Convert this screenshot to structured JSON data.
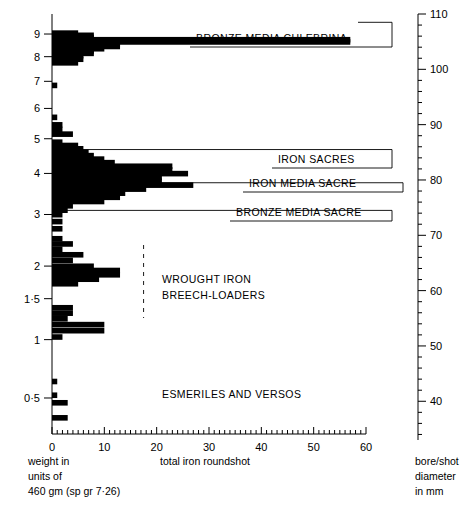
{
  "chart_data": {
    "type": "bar",
    "orientation": "horizontal",
    "title": "",
    "xlabel": "total iron roundshot",
    "ylabel": "weight in units of 460 gm (sp gr 7·26)",
    "ylabel_lines": [
      "weight in",
      "units of",
      "460 gm (sp gr 7·26)"
    ],
    "xlim": [
      0,
      60
    ],
    "xticks": [
      0,
      10,
      20,
      30,
      40,
      50,
      60
    ],
    "xtick_labels": [
      "0",
      "10",
      "20",
      "30",
      "40",
      "50",
      "60"
    ],
    "x_minor_step": 1,
    "grid": false,
    "legend": "none",
    "yticks": [
      0.5,
      1,
      1.5,
      2,
      3,
      4,
      5,
      6,
      7,
      8,
      9
    ],
    "ytick_labels": [
      "0·5",
      "1",
      "1·5",
      "2",
      "3",
      "4",
      "5",
      "6",
      "7",
      "8",
      "9"
    ],
    "secondary_axis": {
      "label_lines": [
        "bore/shot",
        "diameter",
        "in mm"
      ],
      "ticks": [
        40,
        50,
        60,
        70,
        80,
        90,
        100,
        110
      ],
      "tick_labels": [
        "40",
        "50",
        "60",
        "70",
        "80",
        "90",
        "100",
        "110"
      ],
      "minor_step": 2,
      "range_mm": [
        33,
        110
      ]
    },
    "bars": [
      {
        "y": 9.05,
        "value": 5
      },
      {
        "y": 8.95,
        "value": 8
      },
      {
        "y": 8.85,
        "value": 8
      },
      {
        "y": 8.75,
        "value": 57
      },
      {
        "y": 8.65,
        "value": 57
      },
      {
        "y": 8.55,
        "value": 13
      },
      {
        "y": 8.45,
        "value": 13
      },
      {
        "y": 8.35,
        "value": 10
      },
      {
        "y": 8.25,
        "value": 8
      },
      {
        "y": 8.15,
        "value": 8
      },
      {
        "y": 8.05,
        "value": 6
      },
      {
        "y": 7.9,
        "value": 6
      },
      {
        "y": 7.75,
        "value": 5
      },
      {
        "y": 6.85,
        "value": 1
      },
      {
        "y": 5.7,
        "value": 1
      },
      {
        "y": 5.45,
        "value": 2
      },
      {
        "y": 5.3,
        "value": 2
      },
      {
        "y": 5.15,
        "value": 4
      },
      {
        "y": 4.9,
        "value": 2
      },
      {
        "y": 4.8,
        "value": 5
      },
      {
        "y": 4.7,
        "value": 6
      },
      {
        "y": 4.6,
        "value": 7
      },
      {
        "y": 4.5,
        "value": 8
      },
      {
        "y": 4.4,
        "value": 10
      },
      {
        "y": 4.3,
        "value": 12
      },
      {
        "y": 4.2,
        "value": 23
      },
      {
        "y": 4.1,
        "value": 23
      },
      {
        "y": 4.0,
        "value": 26
      },
      {
        "y": 3.9,
        "value": 21
      },
      {
        "y": 3.8,
        "value": 21
      },
      {
        "y": 3.7,
        "value": 27
      },
      {
        "y": 3.6,
        "value": 18
      },
      {
        "y": 3.5,
        "value": 14
      },
      {
        "y": 3.4,
        "value": 13
      },
      {
        "y": 3.3,
        "value": 10
      },
      {
        "y": 3.2,
        "value": 4
      },
      {
        "y": 3.1,
        "value": 3
      },
      {
        "y": 3.0,
        "value": 2
      },
      {
        "y": 2.85,
        "value": 2
      },
      {
        "y": 2.7,
        "value": 2
      },
      {
        "y": 2.5,
        "value": 2
      },
      {
        "y": 2.4,
        "value": 4
      },
      {
        "y": 2.3,
        "value": 2
      },
      {
        "y": 2.2,
        "value": 6
      },
      {
        "y": 2.1,
        "value": 4
      },
      {
        "y": 2.0,
        "value": 8
      },
      {
        "y": 1.93,
        "value": 13
      },
      {
        "y": 1.86,
        "value": 13
      },
      {
        "y": 1.79,
        "value": 9
      },
      {
        "y": 1.72,
        "value": 5
      },
      {
        "y": 1.38,
        "value": 4
      },
      {
        "y": 1.31,
        "value": 4
      },
      {
        "y": 1.24,
        "value": 3
      },
      {
        "y": 1.17,
        "value": 10
      },
      {
        "y": 1.1,
        "value": 10
      },
      {
        "y": 1.03,
        "value": 2
      },
      {
        "y": 0.62,
        "value": 1
      },
      {
        "y": 0.52,
        "value": 1
      },
      {
        "y": 0.47,
        "value": 3
      },
      {
        "y": 0.38,
        "value": 3
      }
    ],
    "annotations": [
      {
        "name": "bronze-media-culebrina",
        "text": "BRONZE MEDIA CULEBRINA",
        "mm": 108.5,
        "text_x": 196,
        "text_y": 42,
        "elbow_x": 392,
        "stub_x": 358
      },
      {
        "name": "iron-sacres",
        "text": "IRON SACRES",
        "mm": 85.5,
        "text_x": 278,
        "text_y": 163,
        "elbow_x": 392,
        "stub_x": 64
      },
      {
        "name": "iron-media-sacre",
        "text": "IRON MEDIA SACRE",
        "mm": 79.5,
        "text_x": 249,
        "text_y": 187,
        "elbow_x": 403,
        "stub_x": 56
      },
      {
        "name": "bronze-media-sacre",
        "text": "BRONZE MEDIA SACRE",
        "mm": 74.5,
        "text_x": 236,
        "text_y": 216,
        "elbow_x": 392,
        "stub_x": 60
      }
    ],
    "group_labels": [
      {
        "name": "wrought-iron-breech-loaders",
        "lines": [
          "WROUGHT IRON",
          "BREECH-LOADERS"
        ],
        "x": 162,
        "y": 283
      },
      {
        "name": "esmeriles-and-versos",
        "lines": [
          "ESMERILES AND VERSOS"
        ],
        "x": 162,
        "y": 398
      }
    ],
    "divider": {
      "name": "vertical-dashed-divider",
      "x_value": 17.5,
      "y_top": 245,
      "y_bottom": 318
    }
  }
}
